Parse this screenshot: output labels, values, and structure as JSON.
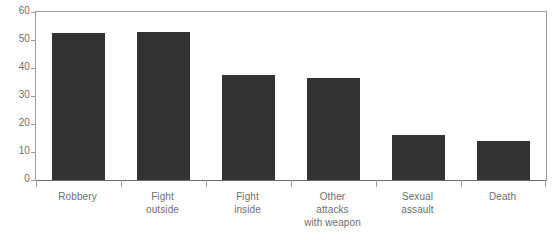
{
  "chart_data": {
    "type": "bar",
    "title": "",
    "subtitle": "",
    "xlabel": "",
    "ylabel": "",
    "ylim": [
      0,
      60
    ],
    "yticks": [
      "0",
      "10",
      "20",
      "30",
      "40",
      "50",
      "60"
    ],
    "grid": false,
    "legend": null,
    "legend_position": "none",
    "bar_color": "#333333",
    "axis_color": "#9a9a9a",
    "label_color": "#6e6e6e",
    "categories": [
      "Robbery",
      "Fight\noutside",
      "Fight\ninside",
      "Other\nattacks\nwith weapon",
      "Sexual\nassault",
      "Death"
    ],
    "category_lines": [
      [
        "Robbery"
      ],
      [
        "Fight",
        "outside"
      ],
      [
        "Fight",
        "inside"
      ],
      [
        "Other",
        "attacks",
        "with weapon"
      ],
      [
        "Sexual",
        "assault"
      ],
      [
        "Death"
      ]
    ],
    "values": [
      52.5,
      53.0,
      37.5,
      36.5,
      16.0,
      14.0
    ]
  }
}
